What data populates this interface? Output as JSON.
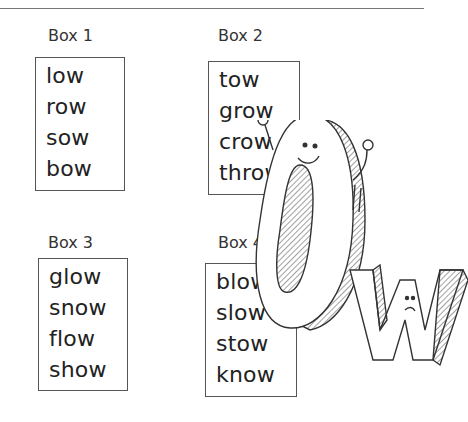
{
  "boxes": [
    {
      "label": "Box 1",
      "words": [
        "low",
        "row",
        "sow",
        "bow"
      ]
    },
    {
      "label": "Box 2",
      "words": [
        "tow",
        "grow",
        "crow",
        "throw"
      ]
    },
    {
      "label": "Box 3",
      "words": [
        "glow",
        "snow",
        "flow",
        "show"
      ]
    },
    {
      "label": "Box 4",
      "words": [
        "blow",
        "slow",
        "stow",
        "know"
      ]
    }
  ],
  "illustration": {
    "letters": "ow",
    "description": "cartoon 3D letters O and W with faces"
  }
}
